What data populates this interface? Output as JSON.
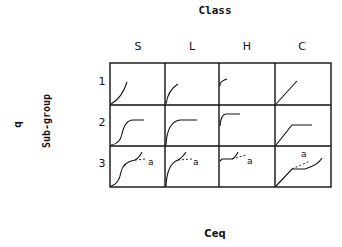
{
  "title": "Class",
  "x_axis_label": "Ceq",
  "y_axis_label": "q",
  "row_group_label": "Sub-group",
  "columns": [
    "S",
    "L",
    "H",
    "C"
  ],
  "rows": [
    "1",
    "2",
    "3"
  ],
  "curve_annotation": "a",
  "cells": [
    {
      "row": "1",
      "col": "S",
      "shape": "convex curve rising from origin"
    },
    {
      "row": "1",
      "col": "L",
      "shape": "concave curve rising from origin"
    },
    {
      "row": "1",
      "col": "H",
      "shape": "steep initial rise (high affinity)"
    },
    {
      "row": "1",
      "col": "C",
      "shape": "straight line through origin"
    },
    {
      "row": "2",
      "col": "S",
      "shape": "S-curve to plateau"
    },
    {
      "row": "2",
      "col": "L",
      "shape": "concave rise to plateau"
    },
    {
      "row": "2",
      "col": "H",
      "shape": "vertical rise then plateau"
    },
    {
      "row": "2",
      "col": "C",
      "shape": "linear rise then plateau"
    },
    {
      "row": "3",
      "col": "S",
      "shape": "S-curve, plateau, second rise with dashed branch a"
    },
    {
      "row": "3",
      "col": "L",
      "shape": "concave rise, plateau, second rise with dashed branch a"
    },
    {
      "row": "3",
      "col": "H",
      "shape": "vertical rise, plateau, second rise with dashed branch a"
    },
    {
      "row": "3",
      "col": "C",
      "shape": "linear rise, plateau, second rise with dashed branch a"
    }
  ]
}
